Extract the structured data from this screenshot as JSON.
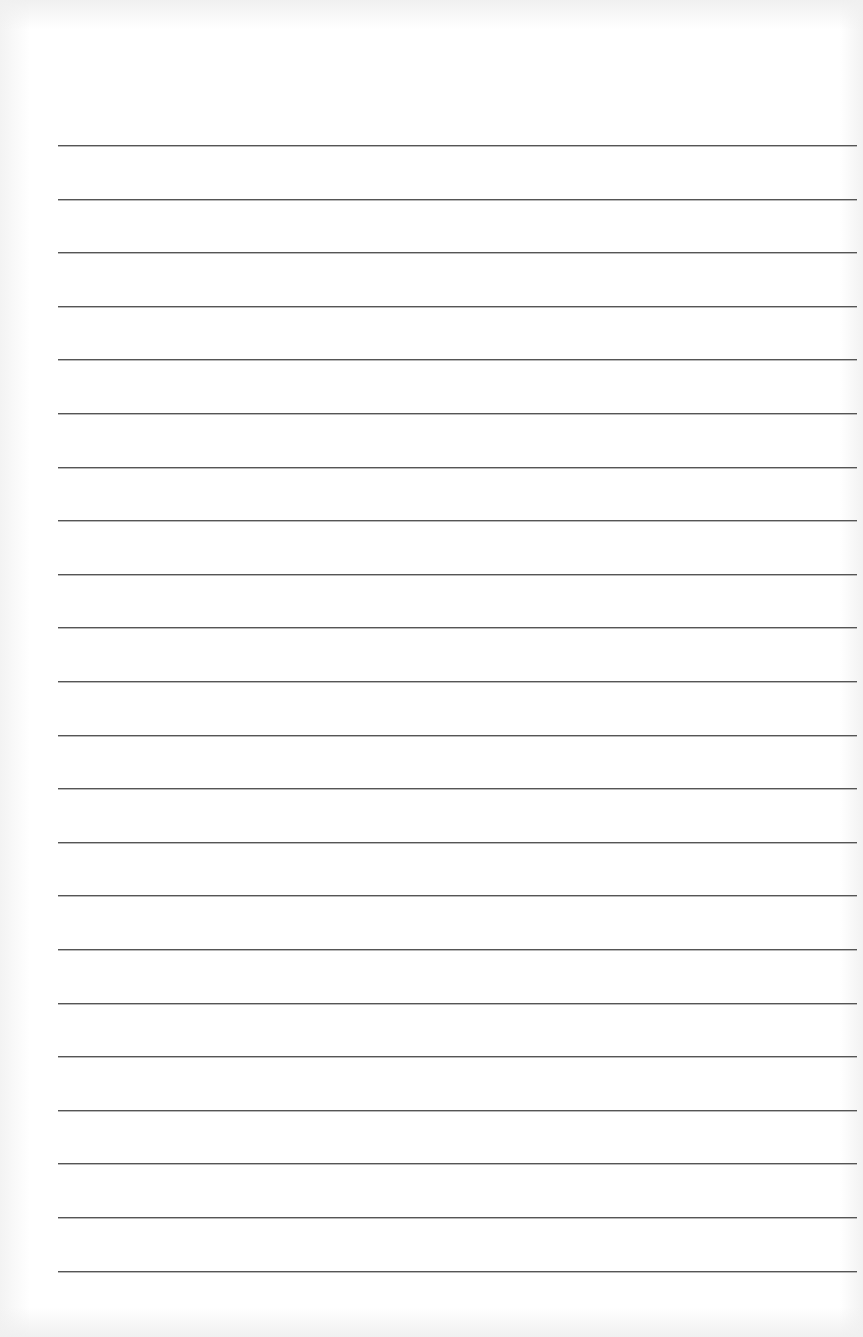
{
  "page": {
    "type": "lined-paper",
    "background_color": "#ffffff",
    "line_color": "#555555",
    "line_count": 22,
    "line_start_x": 58,
    "line_end_x": 857,
    "first_line_y": 145,
    "line_spacing": 53.6
  }
}
